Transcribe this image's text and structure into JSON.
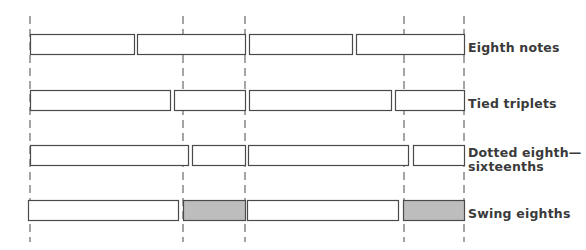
{
  "diagram": {
    "title": "",
    "colors": {
      "stroke": "#4a4a4a",
      "gray_fill": "#bdbdbd",
      "background": "#ffffff",
      "label": "#3a3a3a"
    },
    "beat_lines_x": [
      30,
      183,
      245,
      404,
      464
    ],
    "rows": [
      {
        "label": "Eighth notes",
        "label_line2": "",
        "y": 34,
        "h": 20,
        "bars": [
          {
            "x0": 30,
            "x1": 134,
            "shaded": false
          },
          {
            "x0": 137,
            "x1": 245,
            "shaded": false
          },
          {
            "x0": 249,
            "x1": 352,
            "shaded": false
          },
          {
            "x0": 356,
            "x1": 464,
            "shaded": false
          }
        ]
      },
      {
        "label": "Tied triplets",
        "label_line2": "",
        "y": 90,
        "h": 20,
        "bars": [
          {
            "x0": 30,
            "x1": 170,
            "shaded": false
          },
          {
            "x0": 174,
            "x1": 245,
            "shaded": false
          },
          {
            "x0": 249,
            "x1": 391,
            "shaded": false
          },
          {
            "x0": 395,
            "x1": 464,
            "shaded": false
          }
        ]
      },
      {
        "label": "Dotted eighth—",
        "label_line2": "sixteenths",
        "y": 145,
        "h": 20,
        "bars": [
          {
            "x0": 30,
            "x1": 188,
            "shaded": false
          },
          {
            "x0": 192,
            "x1": 245,
            "shaded": false
          },
          {
            "x0": 248,
            "x1": 408,
            "shaded": false
          },
          {
            "x0": 413,
            "x1": 464,
            "shaded": false
          }
        ]
      },
      {
        "label": "Swing eighths",
        "label_line2": "",
        "y": 200,
        "h": 20,
        "bars": [
          {
            "x0": 28,
            "x1": 178,
            "shaded": false
          },
          {
            "x0": 183,
            "x1": 245,
            "shaded": true
          },
          {
            "x0": 247,
            "x1": 398,
            "shaded": false
          },
          {
            "x0": 403,
            "x1": 464,
            "shaded": true
          }
        ]
      }
    ]
  }
}
